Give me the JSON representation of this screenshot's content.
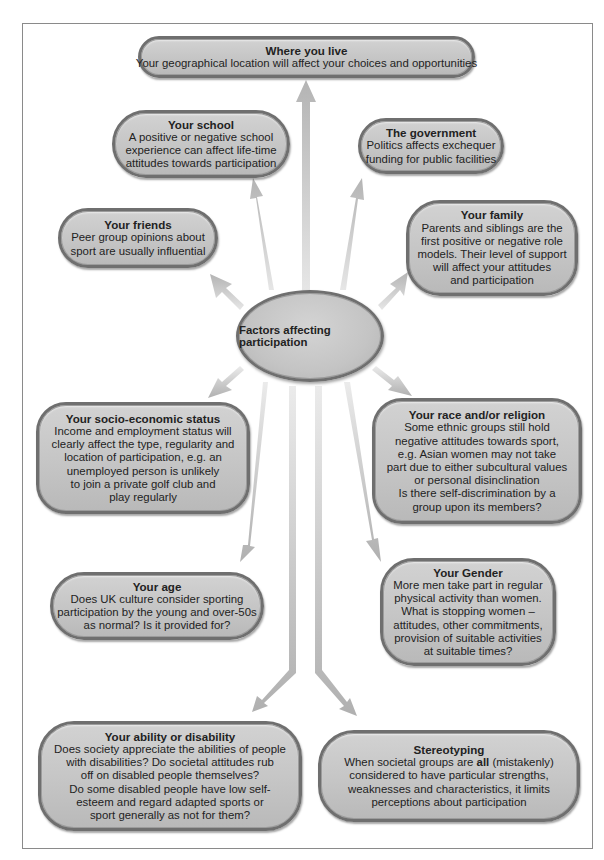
{
  "diagram": {
    "center": {
      "label": "Factors affecting participation"
    },
    "factors": {
      "where_you_live": {
        "title": "Where you live",
        "lines": [
          "Your geographical location will affect your choices and opportunities"
        ]
      },
      "school": {
        "title": "Your school",
        "lines": [
          "A positive or negative school",
          "experience can affect life-time",
          "attitudes towards participation"
        ]
      },
      "government": {
        "title": "The government",
        "lines": [
          "Politics affects exchequer",
          "funding for public facilities"
        ]
      },
      "friends": {
        "title": "Your friends",
        "lines": [
          "Peer group opinions about",
          "sport are usually influential"
        ]
      },
      "family": {
        "title": "Your family",
        "lines": [
          "Parents and siblings are the",
          "first positive or negative role",
          "models. Their level of support",
          "will affect your attitudes",
          "and participation"
        ]
      },
      "socio_economic": {
        "title": "Your socio-economic status",
        "lines": [
          "Income and employment status will",
          "clearly affect the type, regularity and",
          "location of participation, e.g. an",
          "unemployed person is unlikely",
          "to join a private golf club and",
          "play regularly"
        ]
      },
      "race_religion": {
        "title": "Your race and/or religion",
        "lines": [
          "Some ethnic groups still hold",
          "negative attitudes towards sport,",
          "e.g. Asian women may not take",
          "part due to either subcultural values",
          "or personal disinclination",
          "Is there self-discrimination by a",
          "group upon its members?"
        ]
      },
      "age": {
        "title": "Your age",
        "lines": [
          "Does UK culture consider sporting",
          "participation by the young and over-50s",
          "as normal? Is it provided for?"
        ]
      },
      "gender": {
        "title": "Your Gender",
        "lines": [
          "More men take part in regular",
          "physical activity than women.",
          "What is stopping women –",
          "attitudes, other commitments,",
          "provision of suitable activities",
          "at suitable times?"
        ]
      },
      "ability": {
        "title": "Your ability or disability",
        "lines": [
          "Does society appreciate the abilities of people",
          "with disabilities? Do societal attitudes rub",
          "off on disabled people themselves?",
          "Do some disabled people have low self-",
          "esteem and regard adapted sports or",
          "sport generally as not for them?"
        ]
      },
      "stereotyping": {
        "title": "Stereotyping",
        "line1_pre": "When societal groups are ",
        "line1_bold": "all",
        "line1_post": " (mistakenly)",
        "lines": [
          "considered to have particular strengths,",
          "weaknesses and characteristics, it limits",
          "perceptions about participation"
        ]
      }
    },
    "colors": {
      "box_fill": "#c6c6c6",
      "box_border": "#6f6f6f",
      "arrow_fill": "#c8c8c8",
      "frame_border": "#8a8a8a",
      "text": "#222222"
    }
  }
}
